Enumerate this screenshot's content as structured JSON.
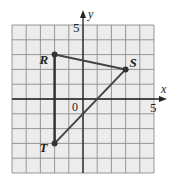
{
  "diagram": {
    "type": "coordinate-plane-triangle",
    "grid": {
      "xmin": -5,
      "xmax": 5,
      "ymin": -5,
      "ymax": 5,
      "step": 1
    },
    "axes": {
      "x_label": "x",
      "y_label": "y",
      "origin_label": "0",
      "x_tick_label": "5",
      "y_tick_label": "5"
    },
    "colors": {
      "grid_background": "#ececec",
      "grid_line": "#8c8c8c",
      "axis": "#222222",
      "edge": "#444444",
      "vertex": "#333333"
    }
  },
  "chart_data": {
    "type": "scatter",
    "title": "",
    "xlabel": "x",
    "ylabel": "y",
    "xlim": [
      -5,
      5
    ],
    "ylim": [
      -5,
      5
    ],
    "grid": true,
    "points": [
      {
        "label": "R",
        "x": -2,
        "y": 3
      },
      {
        "label": "S",
        "x": 3,
        "y": 2
      },
      {
        "label": "T",
        "x": -2,
        "y": -3
      }
    ],
    "segments": [
      [
        "R",
        "S"
      ],
      [
        "S",
        "T"
      ],
      [
        "T",
        "R"
      ]
    ]
  }
}
